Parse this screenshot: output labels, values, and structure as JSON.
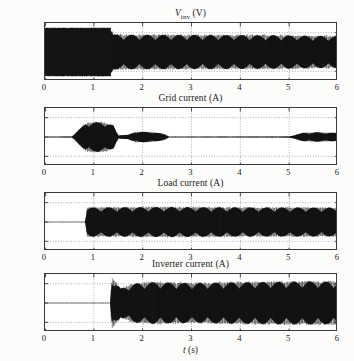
{
  "figure": {
    "background_color": "#fcfcfb",
    "axis_color": "#3a3a3a",
    "trace_color": "#141414",
    "grid_color": "#8c8c8c"
  },
  "xaxis": {
    "title": "t (s)",
    "title_italic": "t",
    "title_unit": "(s)",
    "ticks": [
      "0",
      "1",
      "2",
      "3",
      "4",
      "5",
      "6"
    ],
    "range": [
      0,
      6
    ]
  },
  "yaxis": {
    "ticks": [
      "200",
      "0",
      "−200"
    ],
    "range": [
      -300,
      300
    ]
  },
  "panels": [
    {
      "title_main": "V",
      "title_sub": "inv",
      "title_unit": "(V)",
      "title_plain": "Vinv (V)",
      "name": "inverter-voltage"
    },
    {
      "title_plain": "Grid current (A)",
      "name": "grid-current"
    },
    {
      "title_plain": "Load current (A)",
      "name": "load-current"
    },
    {
      "title_plain": "Inverter current (A)",
      "name": "inverter-current"
    }
  ],
  "chart_data": {
    "type": "line",
    "title": "",
    "xlabel": "t (s)",
    "xlim": [
      0,
      6
    ],
    "ylim": [
      -300,
      300
    ],
    "grid": true,
    "legend": "none",
    "subplots": [
      {
        "title": "Vinv (V)",
        "ylabel": "Vinv (V)",
        "yticks": [
          200,
          0,
          -200
        ],
        "xticks": [
          0,
          1,
          2,
          3,
          4,
          5,
          6
        ],
        "description": "Inverter voltage. Fully saturated dense PWM block of amplitude about 250 V from t=0 to t=1.35 s, then 50 Hz sinusoidal envelope oscillation of amplitude about 175 V with PWM ripple from t=1.35 s to t=6 s.",
        "envelope": [
          {
            "t": 0.0,
            "amplitude": 250
          },
          {
            "t": 1.35,
            "amplitude": 250
          },
          {
            "t": 1.4,
            "amplitude": 180
          },
          {
            "t": 2.0,
            "amplitude": 178
          },
          {
            "t": 3.0,
            "amplitude": 176
          },
          {
            "t": 4.0,
            "amplitude": 175
          },
          {
            "t": 5.0,
            "amplitude": 172
          },
          {
            "t": 5.3,
            "amplitude": 168
          },
          {
            "t": 6.0,
            "amplitude": 165
          }
        ]
      },
      {
        "title": "Grid current (A)",
        "ylabel": "Grid current (A)",
        "yticks": [
          200,
          0,
          -200
        ],
        "xticks": [
          0,
          1,
          2,
          3,
          4,
          5,
          6
        ],
        "description": "Grid current is near zero except three bursts: a large burst of about 150 A peak between t=0.85 and t=1.45 s, a medium burst of about 55 A peak between t=1.7 and t=2.5 s, and a burst of about 45 A peak between t=5.3 and t=6 s.",
        "envelope": [
          {
            "t": 0.0,
            "amplitude": 2
          },
          {
            "t": 0.55,
            "amplitude": 6
          },
          {
            "t": 0.85,
            "amplitude": 150
          },
          {
            "t": 1.2,
            "amplitude": 155
          },
          {
            "t": 1.4,
            "amplitude": 120
          },
          {
            "t": 1.5,
            "amplitude": 20
          },
          {
            "t": 1.7,
            "amplitude": 22
          },
          {
            "t": 1.85,
            "amplitude": 55
          },
          {
            "t": 2.2,
            "amplitude": 52
          },
          {
            "t": 2.45,
            "amplitude": 30
          },
          {
            "t": 2.55,
            "amplitude": 3
          },
          {
            "t": 4.6,
            "amplitude": 5
          },
          {
            "t": 5.0,
            "amplitude": 6
          },
          {
            "t": 5.3,
            "amplitude": 45
          },
          {
            "t": 5.6,
            "amplitude": 48
          },
          {
            "t": 6.0,
            "amplitude": 42
          }
        ]
      },
      {
        "title": "Load current (A)",
        "ylabel": "Load current (A)",
        "yticks": [
          200,
          0,
          -200
        ],
        "xticks": [
          0,
          1,
          2,
          3,
          4,
          5,
          6
        ],
        "description": "Load current is zero until t=0.82 s, then dense oscillation with envelope of about 150 A peak maintained from t=0.82 s through t=6 s.",
        "envelope": [
          {
            "t": 0.0,
            "amplitude": 0
          },
          {
            "t": 0.82,
            "amplitude": 0
          },
          {
            "t": 0.86,
            "amplitude": 150
          },
          {
            "t": 1.5,
            "amplitude": 152
          },
          {
            "t": 2.5,
            "amplitude": 155
          },
          {
            "t": 3.5,
            "amplitude": 152
          },
          {
            "t": 4.5,
            "amplitude": 150
          },
          {
            "t": 5.3,
            "amplitude": 150
          },
          {
            "t": 6.0,
            "amplitude": 148
          }
        ]
      },
      {
        "title": "Inverter current (A)",
        "ylabel": "Inverter current (A)",
        "yticks": [
          200,
          0,
          -200
        ],
        "xticks": [
          0,
          1,
          2,
          3,
          4,
          5,
          6
        ],
        "description": "Inverter current is zero until t=1.35 s, where a sharp transient spike to about 260 A occurs, after which dense oscillation of about 215 A peak continues to t=6 s.",
        "envelope": [
          {
            "t": 0.0,
            "amplitude": 0
          },
          {
            "t": 1.33,
            "amplitude": 0
          },
          {
            "t": 1.37,
            "amplitude": 262
          },
          {
            "t": 1.55,
            "amplitude": 150
          },
          {
            "t": 1.8,
            "amplitude": 200
          },
          {
            "t": 2.2,
            "amplitude": 215
          },
          {
            "t": 3.0,
            "amplitude": 205
          },
          {
            "t": 3.6,
            "amplitude": 212
          },
          {
            "t": 4.5,
            "amplitude": 218
          },
          {
            "t": 5.3,
            "amplitude": 222
          },
          {
            "t": 6.0,
            "amplitude": 220
          }
        ]
      }
    ]
  }
}
